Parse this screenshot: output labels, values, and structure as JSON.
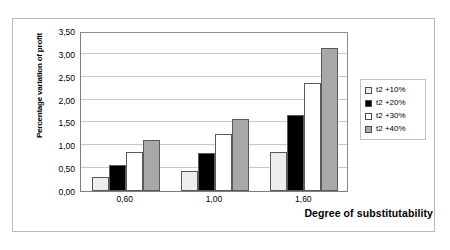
{
  "chart_data": {
    "type": "bar",
    "title": "",
    "xlabel": "Degree of substitutability",
    "ylabel": "Percentage variation of profit",
    "categories": [
      "0,60",
      "1,00",
      "1,60"
    ],
    "series": [
      {
        "name": "t2 +10%",
        "color": "#ededed",
        "values": [
          0.3,
          0.43,
          0.86
        ]
      },
      {
        "name": "t2 +20%",
        "color": "#000000",
        "values": [
          0.58,
          0.83,
          1.67
        ]
      },
      {
        "name": "t2 +30%",
        "color": "#ffffff",
        "values": [
          0.85,
          1.24,
          2.37
        ]
      },
      {
        "name": "t2 +40%",
        "color": "#a8a8a8",
        "values": [
          1.11,
          1.58,
          3.13
        ]
      }
    ],
    "ylim": [
      0,
      3.5
    ],
    "yticks": [
      0,
      0.5,
      1.0,
      1.5,
      2.0,
      2.5,
      3.0,
      3.5
    ],
    "ytick_labels": [
      "0,00",
      "0,50",
      "1,00",
      "1,50",
      "2,00",
      "2,50",
      "3,00",
      "3,50"
    ],
    "grid": true,
    "legend_position": "right"
  }
}
